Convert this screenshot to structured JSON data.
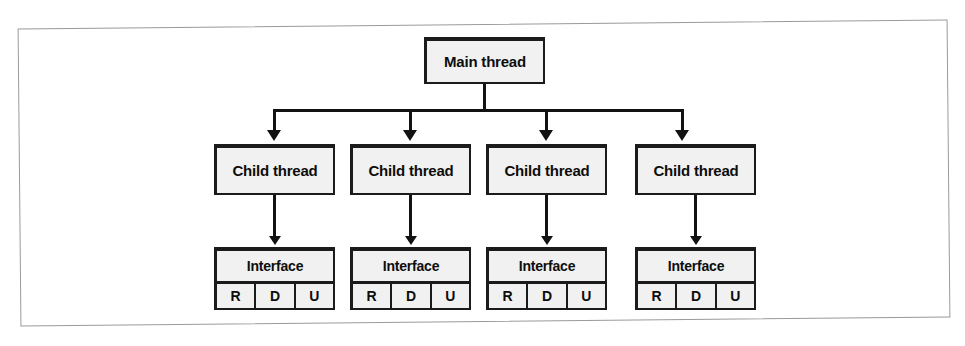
{
  "figure": {
    "background_color": "#ffffff",
    "frame_border_color": "#9a9a9a",
    "node_fill_color": "#f1f1f1",
    "node_border_color": "#1b1b1b",
    "connector_color": "#121212"
  },
  "diagram": {
    "type": "tree",
    "root": {
      "label": "Main thread"
    },
    "children": [
      {
        "label": "Child thread",
        "interface": {
          "header": "Interface",
          "cells": [
            "R",
            "D",
            "U"
          ]
        }
      },
      {
        "label": "Child thread",
        "interface": {
          "header": "Interface",
          "cells": [
            "R",
            "D",
            "U"
          ]
        }
      },
      {
        "label": "Child thread",
        "interface": {
          "header": "Interface",
          "cells": [
            "R",
            "D",
            "U"
          ]
        }
      },
      {
        "label": "Child thread",
        "interface": {
          "header": "Interface",
          "cells": [
            "R",
            "D",
            "U"
          ]
        }
      }
    ]
  }
}
